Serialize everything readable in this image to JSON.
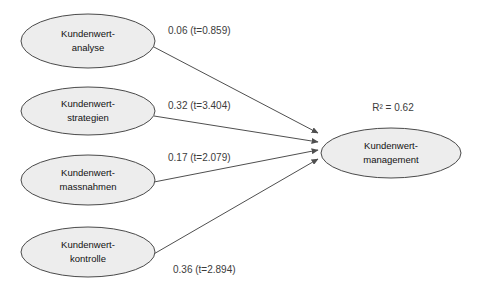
{
  "diagram": {
    "type": "path-model",
    "background_color": "#ffffff",
    "node_fill_color": "#ededed",
    "node_stroke_color": "#4a4a4a",
    "line_color": "#4f4f4f",
    "label_color": "#3c3c3c",
    "node_text_color": "#121212",
    "exogenous_nodes": [
      {
        "id": "kundenwertanalyse",
        "line1": "Kundenwert-",
        "line2": "analyse",
        "cx": 88,
        "cy": 41,
        "rx": 67,
        "ry": 27
      },
      {
        "id": "kundenwertstrategien",
        "line1": "Kundenwert-",
        "line2": "strategien",
        "cx": 88,
        "cy": 111,
        "rx": 67,
        "ry": 24
      },
      {
        "id": "kundenwertmassnahmen",
        "line1": "Kundenwert-",
        "line2": "massnahmen",
        "cx": 88,
        "cy": 180,
        "rx": 67,
        "ry": 25
      },
      {
        "id": "kundenwertkontrolle",
        "line1": "Kundenwert-",
        "line2": "kontrolle",
        "cx": 88,
        "cy": 252,
        "rx": 67,
        "ry": 25
      }
    ],
    "endogenous_node": {
      "id": "kundenwertmanagement",
      "line1": "Kundenwert-",
      "line2": "management",
      "cx": 391,
      "cy": 153,
      "rx": 70,
      "ry": 25
    },
    "r2": {
      "text": "R² = 0.62",
      "x": 393,
      "y": 108
    },
    "paths": [
      {
        "id": "path-analyse",
        "from": "kundenwertanalyse",
        "to": "kundenwertmanagement",
        "coefficient": "0.06",
        "t_value": "t=0.859",
        "label": "0.06 (t=0.859)",
        "label_x": 168,
        "label_y": 31,
        "x1": 152,
        "y1": 46,
        "x2": 318,
        "y2": 133
      },
      {
        "id": "path-strategien",
        "from": "kundenwertstrategien",
        "to": "kundenwertmanagement",
        "coefficient": "0.32",
        "t_value": "t=3.404",
        "label": "0.32 (t=3.404)",
        "label_x": 168,
        "label_y": 106,
        "x1": 154,
        "y1": 116,
        "x2": 318,
        "y2": 142
      },
      {
        "id": "path-massnahmen",
        "from": "kundenwertmassnahmen",
        "to": "kundenwertmanagement",
        "coefficient": "0.17",
        "t_value": "t=2.079",
        "label": "0.17 (t=2.079)",
        "label_x": 168,
        "label_y": 158,
        "x1": 154,
        "y1": 182,
        "x2": 318,
        "y2": 150
      },
      {
        "id": "path-kontrolle",
        "from": "kundenwertkontrolle",
        "to": "kundenwertmanagement",
        "coefficient": "0.36",
        "t_value": "t=2.894",
        "label": "0.36 (t=2.894)",
        "label_x": 173,
        "label_y": 270,
        "x1": 152,
        "y1": 255,
        "x2": 318,
        "y2": 159
      }
    ]
  }
}
